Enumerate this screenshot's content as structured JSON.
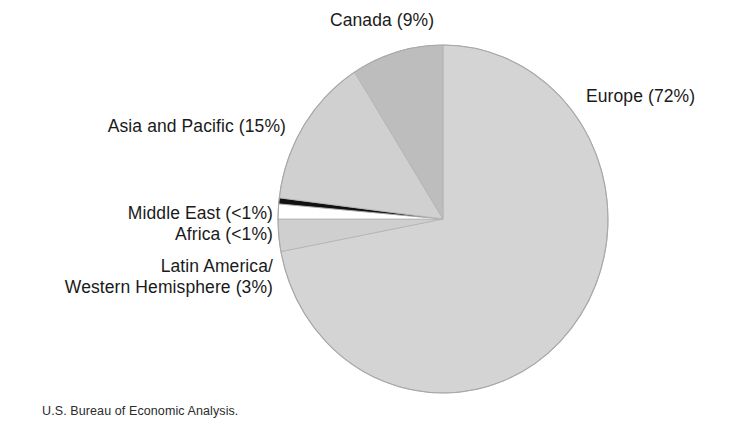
{
  "figure": {
    "background": "#ffffff",
    "source_note": "U.S. Bureau of Economic Analysis."
  },
  "labels": {
    "canada": "Canada (9%)",
    "europe": "Europe (72%)",
    "asia": "Asia and Pacific (15%)",
    "middle_east": "Middle East (<1%)",
    "africa": "Africa (<1%)",
    "latin_line1": "Latin America/",
    "latin_line2": "Western Hemisphere (3%)"
  },
  "chart_data": {
    "type": "pie",
    "title": "",
    "subtitle": "",
    "xlabel": "",
    "ylabel": "",
    "legend_position": "callout-labels",
    "grid": false,
    "start_angle_deg": 90,
    "direction": "clockwise",
    "center": {
      "x": 443,
      "y": 219
    },
    "radius": {
      "rx": 165,
      "ry": 174
    },
    "labels": [
      "Europe",
      "Latin America/Western Hemisphere",
      "Africa",
      "Middle East",
      "Asia and Pacific",
      "Canada"
    ],
    "values": [
      72,
      3,
      0.5,
      0.5,
      15,
      9
    ],
    "display_values": [
      "72%",
      "3%",
      "<1%",
      "<1%",
      "15%",
      "9%"
    ],
    "colors": [
      "#d4d4d4",
      "#cfcfcf",
      "#ffffff",
      "#111111",
      "#d0d0d0",
      "#bdbdbd"
    ],
    "slices": [
      {
        "name": "Europe",
        "label": "Europe (72%)",
        "value": 72,
        "display_value": "72%",
        "color": "#d4d4d4",
        "start_deg": 0,
        "end_deg": 259.2
      },
      {
        "name": "Latin America/Western Hemisphere",
        "label": "Western Hemisphere (3%)",
        "value": 3,
        "display_value": "3%",
        "color": "#cfcfcf",
        "start_deg": 259.2,
        "end_deg": 270.0
      },
      {
        "name": "Africa",
        "label": "Africa (<1%)",
        "value": 0.5,
        "display_value": "<1%",
        "color": "#ffffff",
        "start_deg": 270.0,
        "end_deg": 275.0
      },
      {
        "name": "Middle East",
        "label": "Middle East (<1%)",
        "value": 0.5,
        "display_value": "<1%",
        "color": "#111111",
        "start_deg": 275.0,
        "end_deg": 277.0
      },
      {
        "name": "Asia and Pacific",
        "label": "Asia and Pacific (15%)",
        "value": 15,
        "display_value": "15%",
        "color": "#d0d0d0",
        "start_deg": 277.0,
        "end_deg": 327.6
      },
      {
        "name": "Canada",
        "label": "Canada (9%)",
        "value": 9,
        "display_value": "9%",
        "color": "#bdbdbd",
        "start_deg": 327.6,
        "end_deg": 360.0
      }
    ],
    "total": 100
  }
}
